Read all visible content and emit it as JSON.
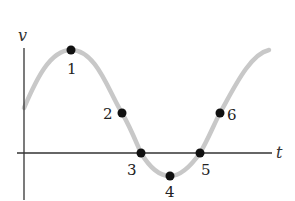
{
  "diagram": {
    "axes": {
      "vertical_label": "v",
      "horizontal_label": "t",
      "axis_color": "#333333"
    },
    "curve": {
      "type": "sinusoid",
      "color": "#c8c8c8"
    },
    "points": [
      {
        "label": "1",
        "x": 71,
        "y": 50
      },
      {
        "label": "2",
        "x": 122,
        "y": 113
      },
      {
        "label": "3",
        "x": 141,
        "y": 153
      },
      {
        "label": "4",
        "x": 170,
        "y": 176
      },
      {
        "label": "5",
        "x": 200,
        "y": 153
      },
      {
        "label": "6",
        "x": 220,
        "y": 113
      }
    ],
    "point_color": "#111111"
  }
}
